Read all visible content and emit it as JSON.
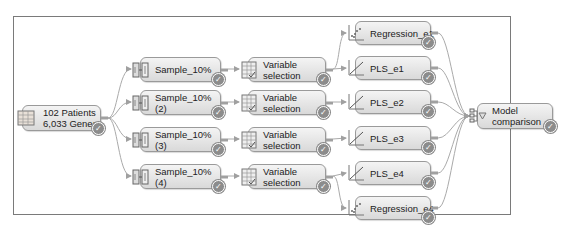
{
  "diagram": {
    "nodes": [
      {
        "id": "source",
        "label": "102 Patients\n6,033 Genes",
        "icon": "data-table-icon",
        "status": "completed"
      },
      {
        "id": "sample1",
        "label": "Sample_10%",
        "icon": "sample-icon",
        "status": "completed"
      },
      {
        "id": "sample2",
        "label": "Sample_10%\n(2)",
        "icon": "sample-icon",
        "status": "completed"
      },
      {
        "id": "sample3",
        "label": "Sample_10%\n(3)",
        "icon": "sample-icon",
        "status": "completed"
      },
      {
        "id": "sample4",
        "label": "Sample_10%\n(4)",
        "icon": "sample-icon",
        "status": "completed"
      },
      {
        "id": "varsel1",
        "label": "Variable\nselection",
        "icon": "variable-selection-icon",
        "status": "completed"
      },
      {
        "id": "varsel2",
        "label": "Variable\nselection",
        "icon": "variable-selection-icon",
        "status": "completed"
      },
      {
        "id": "varsel3",
        "label": "Variable\nselection",
        "icon": "variable-selection-icon",
        "status": "completed"
      },
      {
        "id": "varsel4",
        "label": "Variable\nselection",
        "icon": "variable-selection-icon",
        "status": "completed"
      },
      {
        "id": "reg_e1",
        "label": "Regression_e1",
        "icon": "regression-icon",
        "status": "completed"
      },
      {
        "id": "pls_e1",
        "label": "PLS_e1",
        "icon": "pls-icon",
        "status": "completed"
      },
      {
        "id": "pls_e2",
        "label": "PLS_e2",
        "icon": "pls-icon",
        "status": "completed"
      },
      {
        "id": "pls_e3",
        "label": "PLS_e3",
        "icon": "pls-icon",
        "status": "completed"
      },
      {
        "id": "pls_e4",
        "label": "PLS_e4",
        "icon": "pls-icon",
        "status": "completed"
      },
      {
        "id": "reg_e4",
        "label": "Regression_e4",
        "icon": "regression-icon",
        "status": "completed"
      },
      {
        "id": "modelcomp",
        "label": "Model\ncomparison",
        "icon": "model-comparison-icon",
        "status": "completed"
      }
    ],
    "edges": [
      [
        "source",
        "sample1"
      ],
      [
        "source",
        "sample2"
      ],
      [
        "source",
        "sample3"
      ],
      [
        "source",
        "sample4"
      ],
      [
        "sample1",
        "varsel1"
      ],
      [
        "sample2",
        "varsel2"
      ],
      [
        "sample3",
        "varsel3"
      ],
      [
        "sample4",
        "varsel4"
      ],
      [
        "varsel1",
        "reg_e1"
      ],
      [
        "varsel1",
        "pls_e1"
      ],
      [
        "varsel2",
        "pls_e2"
      ],
      [
        "varsel3",
        "pls_e3"
      ],
      [
        "varsel4",
        "pls_e4"
      ],
      [
        "varsel4",
        "reg_e4"
      ],
      [
        "reg_e1",
        "modelcomp"
      ],
      [
        "pls_e1",
        "modelcomp"
      ],
      [
        "pls_e2",
        "modelcomp"
      ],
      [
        "pls_e3",
        "modelcomp"
      ],
      [
        "pls_e4",
        "modelcomp"
      ],
      [
        "reg_e4",
        "modelcomp"
      ]
    ],
    "status_check_glyph": "✓",
    "colors": {
      "border": "#7a7a7a",
      "node_border": "#9a9a9a",
      "link": "#a8a8a8",
      "check": "#8c8c8c"
    }
  }
}
